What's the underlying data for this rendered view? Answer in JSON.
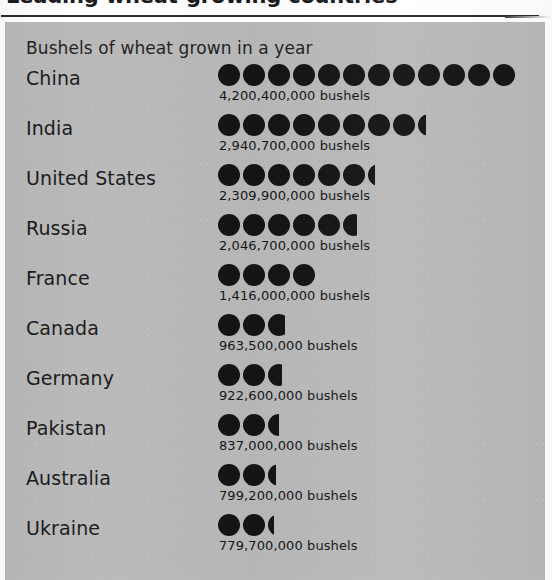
{
  "figure": {
    "title": "Leading wheat-growing countries",
    "subtitle": "Bushels of wheat grown in a year",
    "unit_label": "bushels"
  },
  "colors": {
    "panel_background": "#b9b9b9",
    "symbol": "#141414",
    "text": "#19191b",
    "rule": "#2b2b2d",
    "page_background": "#ffffff"
  },
  "chart_data": {
    "type": "bar",
    "chart_style": "pictogram",
    "title": "Leading wheat-growing countries",
    "subtitle": "Bushels of wheat grown in a year",
    "xlabel": "",
    "ylabel": "",
    "legend": [],
    "grid": false,
    "symbol_unit_value": 350000000,
    "categories": [
      "China",
      "India",
      "United States",
      "Russia",
      "France",
      "Canada",
      "Germany",
      "Pakistan",
      "Australia",
      "Ukraine"
    ],
    "values": [
      4200400000,
      2940700000,
      2309900000,
      2046700000,
      1416000000,
      963500000,
      922600000,
      837000000,
      799200000,
      779700000
    ],
    "value_labels": [
      "4,200,400,000 bushels",
      "2,940,700,000 bushels",
      "2,309,900,000 bushels",
      "2,046,700,000 bushels",
      "1,416,000,000 bushels",
      "963,500,000 bushels",
      "922,600,000 bushels",
      "837,000,000 bushels",
      "799,200,000 bushels",
      "779,700,000 bushels"
    ],
    "symbol_counts": [
      12,
      8.35,
      6.3,
      5.65,
      4,
      2.75,
      2.65,
      2.5,
      2.35,
      2.25
    ],
    "ylim": [
      0,
      4200400000
    ]
  },
  "rows": [
    {
      "country": "China",
      "value_label": "4,200,400,000 bushels",
      "value": 4200400000,
      "full_symbols": 12,
      "partial_fraction": 0
    },
    {
      "country": "India",
      "value_label": "2,940,700,000 bushels",
      "value": 2940700000,
      "full_symbols": 8,
      "partial_fraction": 0.35
    },
    {
      "country": "United States",
      "value_label": "2,309,900,000 bushels",
      "value": 2309900000,
      "full_symbols": 6,
      "partial_fraction": 0.3
    },
    {
      "country": "Russia",
      "value_label": "2,046,700,000 bushels",
      "value": 2046700000,
      "full_symbols": 5,
      "partial_fraction": 0.65
    },
    {
      "country": "France",
      "value_label": "1,416,000,000 bushels",
      "value": 1416000000,
      "full_symbols": 4,
      "partial_fraction": 0
    },
    {
      "country": "Canada",
      "value_label": "963,500,000 bushels",
      "value": 963500000,
      "full_symbols": 2,
      "partial_fraction": 0.75
    },
    {
      "country": "Germany",
      "value_label": "922,600,000 bushels",
      "value": 922600000,
      "full_symbols": 2,
      "partial_fraction": 0.65
    },
    {
      "country": "Pakistan",
      "value_label": "837,000,000 bushels",
      "value": 837000000,
      "full_symbols": 2,
      "partial_fraction": 0.5
    },
    {
      "country": "Australia",
      "value_label": "799,200,000 bushels",
      "value": 799200000,
      "full_symbols": 2,
      "partial_fraction": 0.35
    },
    {
      "country": "Ukraine",
      "value_label": "779,700,000 bushels",
      "value": 779700000,
      "full_symbols": 2,
      "partial_fraction": 0.25
    }
  ]
}
